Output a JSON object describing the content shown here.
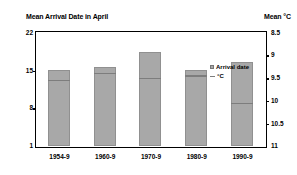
{
  "titles": {
    "left": "Mean Arrival Date in April",
    "right": "Mean °C"
  },
  "legend": {
    "items": [
      {
        "label": "Arrival date",
        "marker": "box",
        "color": "#a8a8a8"
      },
      {
        "label": "°C",
        "marker": "line",
        "color": "#7d7d7d"
      }
    ]
  },
  "chart_data": {
    "type": "bar",
    "title": "Mean Arrival Date in April",
    "xlabel": "",
    "ylabel": "Mean Arrival Date in April",
    "y2label": "Mean °C",
    "categories": [
      "1954-9",
      "1960-9",
      "1970-9",
      "1980-9",
      "1990-9"
    ],
    "series": [
      {
        "name": "Arrival date",
        "axis": "left",
        "type": "bar",
        "values": [
          15.0,
          15.6,
          18.3,
          15.0,
          16.5
        ]
      },
      {
        "name": "°C",
        "axis": "right",
        "type": "line",
        "values": [
          9.55,
          9.4,
          9.5,
          9.45,
          10.05
        ]
      }
    ],
    "ylim": [
      1,
      22
    ],
    "yticks": [
      22,
      15,
      8,
      1
    ],
    "y2lim": [
      8.5,
      11
    ],
    "y2ticks": [
      8.5,
      9,
      9.5,
      10,
      10.5,
      11
    ],
    "y2_inverted": true,
    "grid": false,
    "legend_position": "inside-top-right",
    "bar_color": "#a8a8a8"
  }
}
